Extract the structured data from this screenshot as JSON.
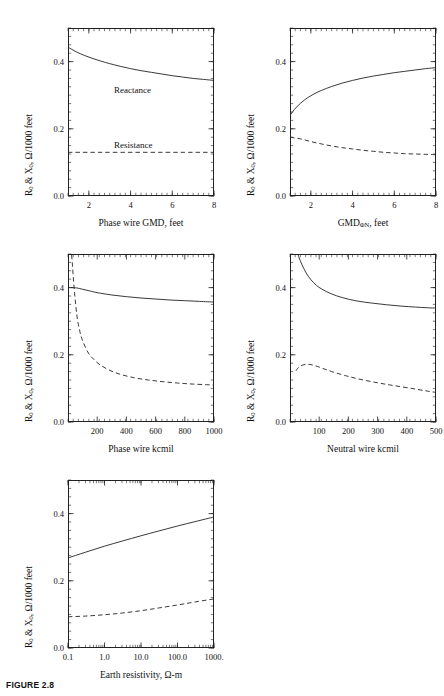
{
  "figure": {
    "caption": "FIGURE 2.8",
    "y_axis_title_html": "R<sub>0</sub> &amp; X<sub>0</sub>, &#937;/1000 feet",
    "series_style": {
      "reactance": "solid",
      "resistance": "dashed"
    }
  },
  "annotations": {
    "reactance": "Reactance",
    "resistance": "Resistance"
  },
  "chart_data": [
    {
      "id": "phase-wire-gmd",
      "type": "line",
      "title": "",
      "xlabel": "Phase wire GMD, feet",
      "xlabel_html": "Phase wire GMD, feet",
      "ylabel": "R0 & X0, Ω/1000 feet",
      "xscale": "linear",
      "xlim": [
        1,
        8
      ],
      "ylim": [
        0.0,
        0.5
      ],
      "xticks": [
        2,
        4,
        6,
        8
      ],
      "xticklabels": [
        "2",
        "4",
        "6",
        "8"
      ],
      "yticks": [
        0.0,
        0.2,
        0.4
      ],
      "yticklabels": [
        "0.0",
        "0.2",
        "0.4"
      ],
      "grid": false,
      "legend": "inline-annotations",
      "series": [
        {
          "name": "Reactance",
          "style": "solid",
          "x": [
            1.0,
            1.4,
            1.8,
            2.2,
            2.6,
            3.0,
            3.5,
            4.0,
            4.5,
            5.0,
            5.5,
            6.0,
            6.5,
            7.0,
            7.5,
            8.0
          ],
          "y": [
            0.443,
            0.429,
            0.418,
            0.409,
            0.401,
            0.394,
            0.386,
            0.379,
            0.373,
            0.368,
            0.363,
            0.358,
            0.354,
            0.35,
            0.347,
            0.344
          ]
        },
        {
          "name": "Resistance",
          "style": "dashed",
          "x": [
            1.0,
            8.0
          ],
          "y": [
            0.13,
            0.13
          ]
        }
      ]
    },
    {
      "id": "gmd-phi-n",
      "type": "line",
      "title": "",
      "xlabel": "GMDΦN, feet",
      "xlabel_html": "GMD<sub>&#934;N</sub>, feet",
      "ylabel": "R0 & X0, Ω/1000 feet",
      "xscale": "linear",
      "xlim": [
        1,
        8
      ],
      "ylim": [
        0.0,
        0.5
      ],
      "xticks": [
        2,
        4,
        6,
        8
      ],
      "xticklabels": [
        "2",
        "4",
        "6",
        "8"
      ],
      "yticks": [
        0.0,
        0.2,
        0.4
      ],
      "yticklabels": [
        "0.0",
        "0.2",
        "0.4"
      ],
      "grid": false,
      "series": [
        {
          "name": "Reactance",
          "style": "solid",
          "x": [
            1.0,
            1.3,
            1.7,
            2.1,
            2.5,
            3.0,
            3.5,
            4.0,
            4.5,
            5.0,
            5.5,
            6.0,
            6.5,
            7.0,
            7.5,
            8.0
          ],
          "y": [
            0.24,
            0.264,
            0.286,
            0.302,
            0.314,
            0.326,
            0.336,
            0.344,
            0.351,
            0.357,
            0.362,
            0.367,
            0.371,
            0.375,
            0.379,
            0.382
          ]
        },
        {
          "name": "Resistance",
          "style": "dashed",
          "x": [
            1.0,
            1.5,
            2.0,
            2.5,
            3.0,
            3.5,
            4.0,
            4.5,
            5.0,
            5.5,
            6.0,
            6.5,
            7.0,
            7.5,
            8.0
          ],
          "y": [
            0.175,
            0.17,
            0.162,
            0.155,
            0.149,
            0.144,
            0.14,
            0.136,
            0.133,
            0.13,
            0.128,
            0.126,
            0.125,
            0.124,
            0.123
          ]
        }
      ]
    },
    {
      "id": "phase-wire-kcmil",
      "type": "line",
      "title": "",
      "xlabel": "Phase wire kcmil",
      "xlabel_html": "Phase wire kcmil",
      "ylabel": "R0 & X0, Ω/1000 feet",
      "xscale": "linear",
      "xlim": [
        0,
        1000
      ],
      "ylim": [
        0.0,
        0.5
      ],
      "xticks": [
        200,
        400,
        600,
        800,
        1000
      ],
      "xticklabels": [
        "200",
        "400",
        "600",
        "800",
        "1000"
      ],
      "yticks": [
        0.0,
        0.2,
        0.4
      ],
      "yticklabels": [
        "0.0",
        "0.2",
        "0.4"
      ],
      "grid": false,
      "series": [
        {
          "name": "Reactance",
          "style": "solid",
          "x": [
            20,
            60,
            100,
            150,
            200,
            300,
            400,
            500,
            600,
            700,
            800,
            900,
            1000
          ],
          "y": [
            0.4,
            0.399,
            0.395,
            0.39,
            0.385,
            0.378,
            0.373,
            0.369,
            0.366,
            0.363,
            0.361,
            0.359,
            0.357
          ]
        },
        {
          "name": "Resistance",
          "style": "dashed",
          "x": [
            20,
            30,
            40,
            60,
            80,
            100,
            140,
            180,
            220,
            280,
            350,
            450,
            550,
            650,
            750,
            850,
            950,
            1000
          ],
          "y": [
            0.52,
            0.47,
            0.41,
            0.32,
            0.272,
            0.242,
            0.205,
            0.185,
            0.17,
            0.155,
            0.143,
            0.132,
            0.125,
            0.12,
            0.116,
            0.113,
            0.111,
            0.11
          ]
        }
      ]
    },
    {
      "id": "neutral-wire-kcmil",
      "type": "line",
      "title": "",
      "xlabel": "Neutral wire kcmil",
      "xlabel_html": "Neutral wire kcmil",
      "ylabel": "R0 & X0, Ω/1000 feet",
      "xscale": "linear",
      "xlim": [
        0,
        500
      ],
      "ylim": [
        0.0,
        0.5
      ],
      "xticks": [
        100,
        200,
        300,
        400,
        500
      ],
      "xticklabels": [
        "100",
        "200",
        "300",
        "400",
        "500"
      ],
      "yticks": [
        0.0,
        0.2,
        0.4
      ],
      "yticklabels": [
        "0.0",
        "0.2",
        "0.4"
      ],
      "grid": false,
      "series": [
        {
          "name": "Reactance",
          "style": "solid",
          "x": [
            20,
            30,
            40,
            55,
            70,
            90,
            110,
            140,
            180,
            230,
            280,
            330,
            380,
            430,
            470,
            500
          ],
          "y": [
            0.52,
            0.492,
            0.47,
            0.444,
            0.425,
            0.407,
            0.395,
            0.382,
            0.37,
            0.36,
            0.354,
            0.349,
            0.345,
            0.342,
            0.34,
            0.339
          ]
        },
        {
          "name": "Resistance",
          "style": "dashed",
          "x": [
            20,
            30,
            45,
            60,
            75,
            95,
            120,
            150,
            190,
            230,
            280,
            330,
            380,
            430,
            470,
            500
          ],
          "y": [
            0.152,
            0.163,
            0.17,
            0.172,
            0.17,
            0.165,
            0.157,
            0.148,
            0.138,
            0.129,
            0.12,
            0.112,
            0.105,
            0.098,
            0.092,
            0.088
          ]
        }
      ]
    },
    {
      "id": "earth-resistivity",
      "type": "line",
      "title": "",
      "xlabel": "Earth resistivity, Ω-m",
      "xlabel_html": "Earth resistivity, &#937;-m",
      "ylabel": "R0 & X0, Ω/1000 feet",
      "xscale": "log",
      "xlim": [
        0.1,
        1000
      ],
      "ylim": [
        0.0,
        0.5
      ],
      "xticks": [
        0.1,
        1.0,
        10.0,
        100.0,
        1000.0
      ],
      "xticklabels": [
        "0.1",
        "1.0",
        "10.0",
        "100.0",
        "1000."
      ],
      "yticks": [
        0.0,
        0.2,
        0.4
      ],
      "yticklabels": [
        "0.0",
        "0.2",
        "0.4"
      ],
      "grid": false,
      "series": [
        {
          "name": "Reactance",
          "style": "solid",
          "x": [
            0.1,
            0.3,
            1.0,
            3.0,
            10.0,
            30.0,
            100.0,
            300.0,
            1000.0
          ],
          "y": [
            0.268,
            0.285,
            0.303,
            0.318,
            0.334,
            0.348,
            0.363,
            0.376,
            0.39
          ]
        },
        {
          "name": "Resistance",
          "style": "dashed",
          "x": [
            0.1,
            0.3,
            1.0,
            3.0,
            10.0,
            30.0,
            100.0,
            300.0,
            1000.0
          ],
          "y": [
            0.093,
            0.095,
            0.099,
            0.104,
            0.111,
            0.119,
            0.128,
            0.137,
            0.146
          ]
        }
      ]
    }
  ]
}
